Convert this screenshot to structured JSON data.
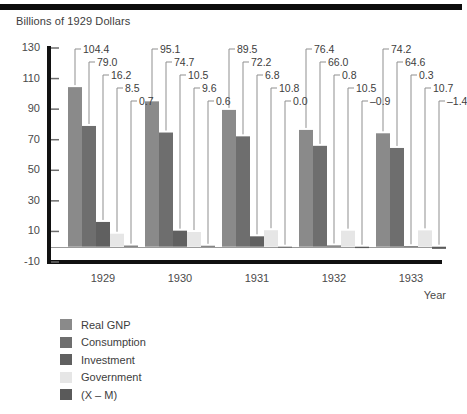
{
  "chart_data": {
    "type": "bar",
    "title": "Billions of 1929 Dollars",
    "xlabel": "Year",
    "ylabel": "Billions of 1929 Dollars",
    "categories": [
      "1929",
      "1930",
      "1931",
      "1932",
      "1933"
    ],
    "ylim": [
      -10,
      130
    ],
    "yticks": [
      "130",
      "110",
      "90",
      "70",
      "50",
      "30",
      "10",
      "-10"
    ],
    "ytick_values": [
      130,
      110,
      90,
      70,
      50,
      30,
      10,
      -10
    ],
    "grid": false,
    "legend_position": "bottom-left",
    "zero_line": true,
    "series": [
      {
        "name": "Real GNP",
        "color": "#8a8a8a",
        "values": [
          104.4,
          95.1,
          89.5,
          76.4,
          74.2
        ]
      },
      {
        "name": "Consumption",
        "color": "#6e6e6e",
        "values": [
          79.0,
          74.7,
          72.2,
          66.0,
          64.6
        ]
      },
      {
        "name": "Investment",
        "color": "#606060",
        "values": [
          16.2,
          10.5,
          6.8,
          0.8,
          0.3
        ]
      },
      {
        "name": "Government",
        "color": "#e6e6e6",
        "values": [
          8.5,
          9.6,
          10.8,
          10.5,
          10.7
        ]
      },
      {
        "name": "(X – M)",
        "color": "#5a5a5a",
        "values": [
          0.7,
          0.6,
          0.0,
          -0.9,
          -1.4
        ]
      }
    ],
    "data_labels": {
      "1929": [
        "104.4",
        "79.0",
        "16.2",
        "8.5",
        "0.7"
      ],
      "1930": [
        "95.1",
        "74.7",
        "10.5",
        "9.6",
        "0.6"
      ],
      "1931": [
        "89.5",
        "72.2",
        "6.8",
        "10.8",
        "0.0"
      ],
      "1932": [
        "76.4",
        "66.0",
        "0.8",
        "10.5",
        "–0.9"
      ],
      "1933": [
        "74.2",
        "64.6",
        "0.3",
        "10.7",
        "–1.4"
      ]
    }
  },
  "legend": {
    "items": [
      {
        "label": "Real GNP"
      },
      {
        "label": "Consumption"
      },
      {
        "label": "Investment"
      },
      {
        "label": "Government"
      },
      {
        "label": "(X – M)"
      }
    ]
  }
}
